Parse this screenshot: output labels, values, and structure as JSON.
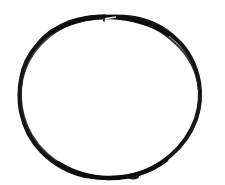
{
  "image": {
    "kind": "scanned-sketch",
    "subject": "hand-drawn circle",
    "caption": "A single closed hand-drawn circle outline in black ink on a plain white background.",
    "width": 225,
    "height": 185,
    "background_color": "#ffffff",
    "ink_color": "#111111"
  },
  "sketch": {
    "name": "circle-outline",
    "stroke_color": "#141414",
    "stroke_width_px": 4,
    "closed": true,
    "fill": "none",
    "bounds": {
      "x_min": 19,
      "y_min": 15,
      "x_max": 201,
      "y_max": 178
    },
    "center": {
      "x": 110,
      "y": 96
    },
    "radius_x_px": 91,
    "radius_y_px": 81,
    "notes": [
      "stroke is slightly irregular / wobbly, widest at top and bottom",
      "small overlap notch where the stroke closes near the top",
      "short tail flick near the bottom-right of the stroke"
    ],
    "overlap_notch": {
      "x": 108,
      "y": 17,
      "width": 9,
      "height": 4
    },
    "tail_flick": {
      "x": 129,
      "y": 175,
      "width": 8,
      "height": 4
    },
    "path": "M 108 17 C 86 17 62 25 45 42 C 28 58 20 76 19 96 C 18 118 26 139 42 155 C 58 171 82 178 108 178 C 134 178 160 171 177 154 C 194 137 201 115 200 95 C 199 73 190 53 173 38 C 156 24 133 17 108 17 Z"
  },
  "accessibility": {
    "alt_text": "Hand-drawn black circle on white paper"
  }
}
